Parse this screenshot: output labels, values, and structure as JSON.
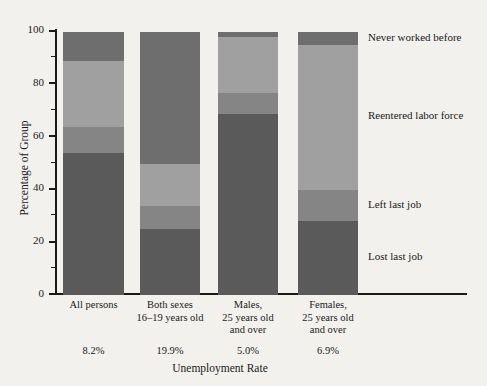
{
  "chart_data": {
    "type": "bar",
    "subtype": "stacked-percentage",
    "title": "",
    "xlabel": "Unemployment Rate",
    "ylabel": "Percentage of Group",
    "ylim": [
      0,
      100
    ],
    "y_ticks_major": [
      0,
      20,
      40,
      60,
      80,
      100
    ],
    "y_ticks_minor": [
      10,
      30,
      50,
      70,
      90
    ],
    "grid": false,
    "legend_position": "right",
    "categories": [
      "All persons",
      "Both sexes 16–19 years old",
      "Males, 25 years old and over",
      "Females, 25 years old and over"
    ],
    "category_lines": [
      [
        "All persons"
      ],
      [
        "Both sexes",
        "16–19 years old"
      ],
      [
        "Males,",
        "25 years old",
        "and over"
      ],
      [
        "Females,",
        "25 years old",
        "and over"
      ]
    ],
    "category_rates": [
      "8.2%",
      "19.9%",
      "5.0%",
      "6.9%"
    ],
    "series": [
      {
        "name": "Lost last job",
        "color": "#5a5a5a",
        "values": [
          54,
          25,
          69,
          28
        ]
      },
      {
        "name": "Left last job",
        "color": "#858585",
        "values": [
          10,
          9,
          8,
          12
        ]
      },
      {
        "name": "Reentered labor force",
        "color": "#a0a0a0",
        "values": [
          25,
          16,
          21,
          55
        ]
      },
      {
        "name": "Never worked before",
        "color": "#6e6e6e",
        "values": [
          11,
          50,
          2,
          5
        ]
      }
    ],
    "legend_entries": [
      "Never worked before",
      "Reentered labor force",
      "Left last job",
      "Lost last job"
    ]
  },
  "axes": {
    "y_title": "Percentage of Group",
    "x_title": "Unemployment Rate",
    "y_labels": [
      "100",
      "80",
      "60",
      "40",
      "20",
      "0"
    ]
  }
}
